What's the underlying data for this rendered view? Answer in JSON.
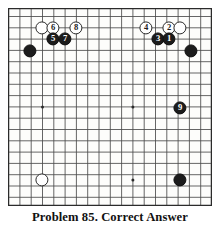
{
  "figure": {
    "caption": "Problem 85. Correct Answer",
    "kind": "go-board-diagram"
  },
  "board": {
    "columns": 18,
    "rows": 17,
    "spacing_px": 11.3,
    "origin_x_px": 8,
    "origin_y_px": 8,
    "star_points": [
      {
        "col": 3,
        "row": 9
      },
      {
        "col": 9,
        "row": 9
      },
      {
        "col": 3,
        "row": 15
      },
      {
        "col": 9,
        "row": 15
      },
      {
        "col": 15,
        "row": 15
      }
    ],
    "colors": {
      "line": "#4a4a4a",
      "edge": "#2b2b2b",
      "black_stone": "#1c1c1c",
      "white_stone": "#ffffff",
      "background": "#fdfdfb"
    }
  },
  "stones": [
    {
      "id": "white-plain-top-left",
      "color": "white",
      "label": "",
      "x": 42,
      "y": 28
    },
    {
      "id": "white-6",
      "color": "white",
      "label": "6",
      "x": 53,
      "y": 28
    },
    {
      "id": "white-8",
      "color": "white",
      "label": "8",
      "x": 76,
      "y": 28
    },
    {
      "id": "black-5",
      "color": "black",
      "label": "5",
      "x": 53,
      "y": 39
    },
    {
      "id": "black-7",
      "color": "black",
      "label": "7",
      "x": 65,
      "y": 39
    },
    {
      "id": "black-corner-left",
      "color": "black",
      "label": "",
      "x": 30,
      "y": 51
    },
    {
      "id": "white-4",
      "color": "white",
      "label": "4",
      "x": 146,
      "y": 28
    },
    {
      "id": "white-2",
      "color": "white",
      "label": "2",
      "x": 169,
      "y": 28
    },
    {
      "id": "white-plain-top-right",
      "color": "white",
      "label": "",
      "x": 180,
      "y": 28
    },
    {
      "id": "black-3",
      "color": "black",
      "label": "3",
      "x": 158,
      "y": 39
    },
    {
      "id": "black-1",
      "color": "black",
      "label": "1",
      "x": 169,
      "y": 39
    },
    {
      "id": "black-corner-right",
      "color": "black",
      "label": "",
      "x": 191,
      "y": 51
    },
    {
      "id": "black-9",
      "color": "black",
      "label": "9",
      "x": 180,
      "y": 108
    },
    {
      "id": "white-plain-bottom-left",
      "color": "white",
      "label": "",
      "x": 42,
      "y": 180
    },
    {
      "id": "black-plain-bottom-right",
      "color": "black",
      "label": "",
      "x": 180,
      "y": 180
    }
  ]
}
